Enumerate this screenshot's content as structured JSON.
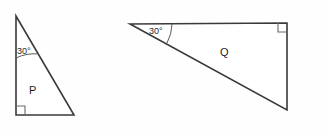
{
  "figure": {
    "background_color": "#fefefe",
    "stroke_color": "#3a3a3a",
    "shapes": [
      {
        "id": "triangle-p",
        "label": "P",
        "angle_label": "30°",
        "right_angle_at": "bottom-left",
        "vertices": [
          [
            16,
            16
          ],
          [
            16,
            115
          ],
          [
            74,
            115
          ]
        ]
      },
      {
        "id": "triangle-q",
        "label": "Q",
        "angle_label": "30°",
        "right_angle_at": "top-right",
        "vertices": [
          [
            130,
            24
          ],
          [
            287,
            23
          ],
          [
            287,
            110
          ]
        ]
      }
    ]
  },
  "labels": {
    "p_shape": "P",
    "q_shape": "Q",
    "p_angle": "30°",
    "q_angle": "30°"
  }
}
